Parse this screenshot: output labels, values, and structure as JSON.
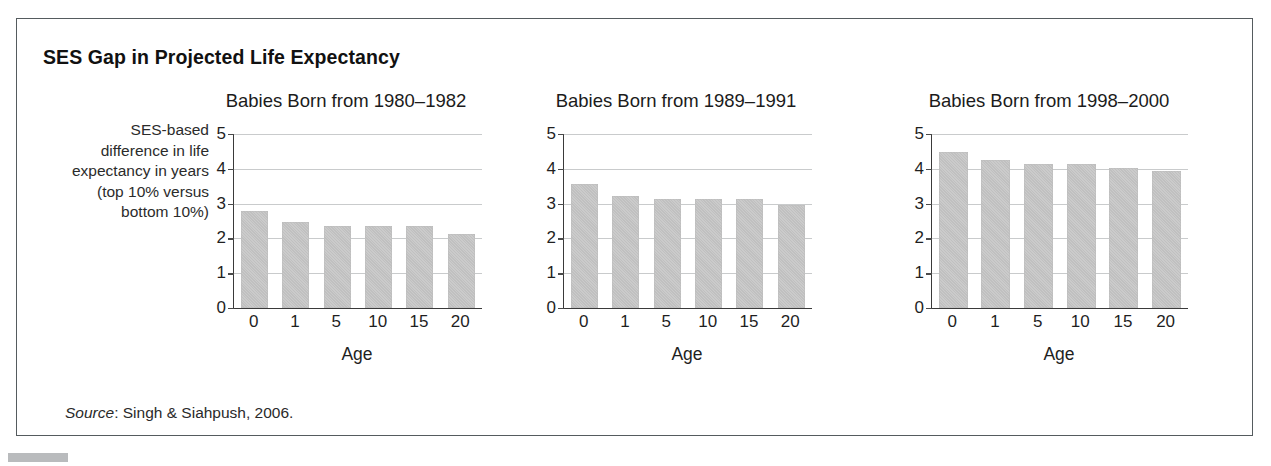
{
  "figure": {
    "title": "SES Gap in Projected Life Expectancy",
    "y_axis_caption": "SES-based difference in life expectancy in years (top 10% versus bottom 10%)",
    "source_label": "Source",
    "source_separator": ": ",
    "source_text": "Singh & Siahpush, 2006.",
    "frame_color": "#555b5e",
    "bar_color": "#c5c5c5",
    "gridline_color": "#c9cbcc",
    "axis_color": "#3a3a3a"
  },
  "chart_data": [
    {
      "type": "bar",
      "title": "Babies Born from 1980–1982",
      "xlabel": "Age",
      "ylabel": "SES-based difference in life expectancy in years (top 10% versus bottom 10%)",
      "categories": [
        "0",
        "1",
        "5",
        "10",
        "15",
        "20"
      ],
      "values": [
        2.78,
        2.48,
        2.37,
        2.37,
        2.37,
        2.13
      ],
      "ylim": [
        0,
        5
      ],
      "yticks": [
        "0",
        "1",
        "2",
        "3",
        "4",
        "5"
      ],
      "grid": true,
      "legend": "none"
    },
    {
      "type": "bar",
      "title": "Babies Born from 1989–1991",
      "xlabel": "Age",
      "ylabel": "SES-based difference in life expectancy in years (top 10% versus bottom 10%)",
      "categories": [
        "0",
        "1",
        "5",
        "10",
        "15",
        "20"
      ],
      "values": [
        3.55,
        3.23,
        3.12,
        3.12,
        3.12,
        2.95
      ],
      "ylim": [
        0,
        5
      ],
      "yticks": [
        "0",
        "1",
        "2",
        "3",
        "4",
        "5"
      ],
      "grid": true,
      "legend": "none"
    },
    {
      "type": "bar",
      "title": "Babies Born from 1998–2000",
      "xlabel": "Age",
      "ylabel": "SES-based difference in life expectancy in years (top 10% versus bottom 10%)",
      "categories": [
        "0",
        "1",
        "5",
        "10",
        "15",
        "20"
      ],
      "values": [
        4.48,
        4.25,
        4.15,
        4.15,
        4.03,
        3.93
      ],
      "ylim": [
        0,
        5
      ],
      "yticks": [
        "0",
        "1",
        "2",
        "3",
        "4",
        "5"
      ],
      "grid": true,
      "legend": "none"
    }
  ]
}
